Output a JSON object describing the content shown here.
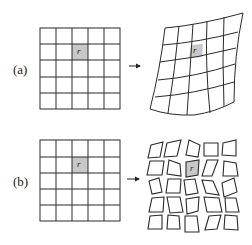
{
  "panels": [
    {
      "label": "(a)",
      "description": "Regular 5x5 grid maps to a smoothly deformed continuous grid",
      "highlighted_cell_symbol": "r⃗",
      "arrow": "→"
    },
    {
      "label": "(b)",
      "description": "Regular 5x5 grid maps to disconnected, individually distorted cells",
      "highlighted_cell_symbol": "r⃗",
      "arrow": "→"
    }
  ],
  "colors": {
    "line": "#2a2a2a",
    "highlight": "#c8c8c8",
    "background": "#ffffff"
  }
}
